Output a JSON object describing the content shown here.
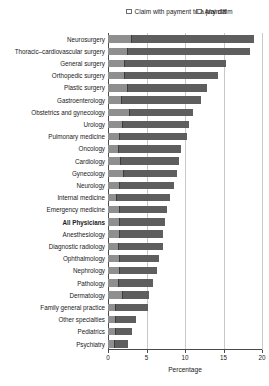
{
  "chart_data": {
    "type": "bar",
    "orientation": "horizontal",
    "stacked": "overlaid",
    "title": "",
    "xlabel": "Percentage",
    "ylabel": "",
    "xlim": [
      0,
      20
    ],
    "xticks": [
      0,
      5,
      10,
      15,
      20
    ],
    "grid": true,
    "legend_position": "top",
    "categories": [
      "Neurosurgery",
      "Thoracic–cardiovascular surgery",
      "General surgery",
      "Orthopedic surgery",
      "Plastic surgery",
      "Gastroenterology",
      "Obstetrics and gynecology",
      "Urology",
      "Pulmonary medicine",
      "Oncology",
      "Cardiology",
      "Gynecology",
      "Neurology",
      "Internal medicine",
      "Emergency medicine",
      "All Physicians",
      "Anesthesiology",
      "Diagnostic radiology",
      "Ophthalmology",
      "Nephrology",
      "Pathology",
      "Dermatology",
      "Family general practice",
      "Other specialties",
      "Pediatrics",
      "Psychiatry"
    ],
    "highlight_category": "All Physicians",
    "series": [
      {
        "name": "Any claim",
        "color": "#5e5e5e",
        "values": [
          18.9,
          18.4,
          15.3,
          14.3,
          12.8,
          12.1,
          11.1,
          10.5,
          10.2,
          9.5,
          9.2,
          9.0,
          8.6,
          8.1,
          7.7,
          7.4,
          7.2,
          7.1,
          6.6,
          6.3,
          5.8,
          5.3,
          5.2,
          3.7,
          3.1,
          2.6
        ]
      },
      {
        "name": "Claim with payment to a plaintiff",
        "color": "#8f8f8f",
        "values": [
          3.1,
          2.6,
          2.2,
          2.2,
          2.6,
          1.8,
          2.8,
          1.9,
          1.5,
          1.4,
          1.7,
          2.1,
          1.6,
          1.2,
          1.5,
          1.6,
          1.6,
          1.4,
          1.5,
          1.6,
          1.4,
          1.9,
          1.1,
          1.1,
          1.1,
          0.9
        ]
      }
    ]
  },
  "legend": {
    "items": [
      {
        "label": "Claim with payment\nto a plaintiff",
        "key": "paid"
      },
      {
        "label": "Any claim",
        "key": "any"
      }
    ]
  },
  "axis": {
    "x_title": "Percentage"
  }
}
